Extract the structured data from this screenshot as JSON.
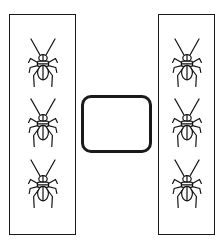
{
  "scene": {
    "title": "Two insect enclosures with empty center container",
    "background_color": "#ffffff",
    "stroke_color": "#1a1a1a",
    "width": 223,
    "height": 242
  },
  "panels": [
    {
      "id": "left",
      "label": "Left enclosure",
      "insect_count": 3,
      "insects": [
        {
          "label": "cricket"
        },
        {
          "label": "cricket"
        },
        {
          "label": "cricket"
        }
      ]
    },
    {
      "id": "right",
      "label": "Right enclosure",
      "insect_count": 3,
      "insects": [
        {
          "label": "cricket"
        },
        {
          "label": "cricket"
        },
        {
          "label": "cricket"
        }
      ]
    }
  ],
  "center_card": {
    "label": "Empty rounded container",
    "content": "",
    "insect_count": 0
  },
  "icons": {
    "insect": "cricket-icon"
  }
}
